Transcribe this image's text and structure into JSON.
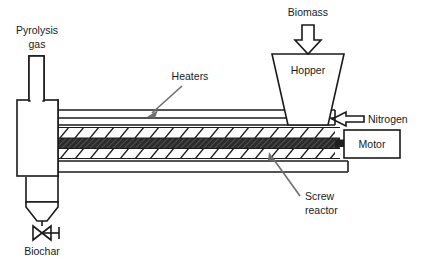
{
  "figure": {
    "background_color": "#ffffff",
    "line_color": "#1a1a1a",
    "callout_color": "#6e6e6e",
    "shaft_fill": "#231f20",
    "width": 425,
    "height": 268
  },
  "labels": {
    "pyrolysis_gas_line1": "Pyrolysis",
    "pyrolysis_gas_line2": "gas",
    "heaters": "Heaters",
    "biomass": "Biomass",
    "hopper": "Hopper",
    "nitrogen": "Nitrogen",
    "motor": "Motor",
    "screw_reactor_line1": "Screw",
    "screw_reactor_line2": "reactor",
    "biochar": "Biochar"
  },
  "components": [
    {
      "id": "pyrolysis-gas-pipe",
      "label": "Pyrolysis gas",
      "type": "outlet-pipe",
      "position": "top-left"
    },
    {
      "id": "condenser-vessel",
      "label": "",
      "type": "vessel",
      "position": "left"
    },
    {
      "id": "biochar-cone",
      "label": "Biochar",
      "type": "cone-outlet",
      "position": "bottom-left"
    },
    {
      "id": "biochar-valve",
      "label": "",
      "type": "valve",
      "position": "bottom-left"
    },
    {
      "id": "heater-jacket",
      "label": "Heaters",
      "type": "jacket",
      "position": "top-of-barrel"
    },
    {
      "id": "screw-reactor",
      "label": "Screw reactor",
      "type": "screw-conveyor",
      "position": "center"
    },
    {
      "id": "hopper",
      "label": "Hopper",
      "type": "hopper",
      "position": "top-right"
    },
    {
      "id": "biomass-inlet",
      "label": "Biomass",
      "type": "inlet-arrow",
      "position": "top-right"
    },
    {
      "id": "nitrogen-inlet",
      "label": "Nitrogen",
      "type": "inlet-arrow",
      "position": "right"
    },
    {
      "id": "motor",
      "label": "Motor",
      "type": "motor-box",
      "position": "right"
    }
  ]
}
